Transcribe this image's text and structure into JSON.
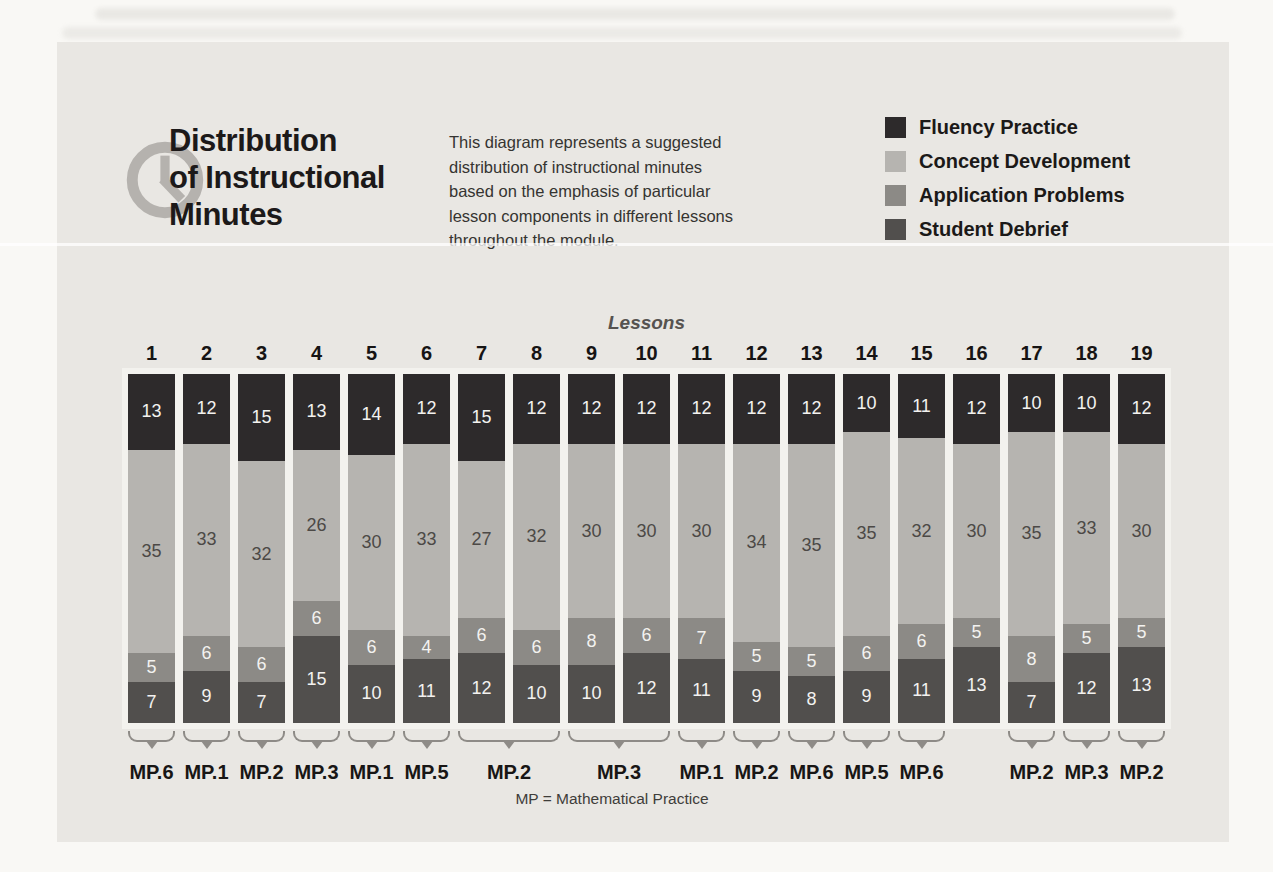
{
  "header": {
    "title_lines": [
      "Distribution",
      "of Instructional",
      "Minutes"
    ],
    "description": "This diagram represents a suggested distribution of instructional minutes based on the emphasis of particular lesson components in different lessons throughout the module."
  },
  "legend": {
    "items": [
      {
        "label": "Fluency Practice",
        "color": "#2d2a2b"
      },
      {
        "label": "Concept Development",
        "color": "#b6b4b0"
      },
      {
        "label": "Application Problems",
        "color": "#8c8a86"
      },
      {
        "label": "Student Debrief",
        "color": "#514f4d"
      }
    ]
  },
  "chart_data": {
    "type": "bar",
    "stacked": true,
    "axis_label": "Lessons",
    "total_per_bar": 60,
    "categories": [
      "1",
      "2",
      "3",
      "4",
      "5",
      "6",
      "7",
      "8",
      "9",
      "10",
      "11",
      "12",
      "13",
      "14",
      "15",
      "16",
      "17",
      "18",
      "19"
    ],
    "series": [
      {
        "name": "Fluency Practice",
        "color": "#2d2a2b",
        "text_color": "#f3f2f0",
        "values": [
          13,
          12,
          15,
          13,
          14,
          12,
          15,
          12,
          12,
          12,
          12,
          12,
          12,
          10,
          11,
          12,
          10,
          10,
          12
        ]
      },
      {
        "name": "Concept Development",
        "color": "#b6b4b0",
        "text_color": "#4c4946",
        "values": [
          35,
          33,
          32,
          26,
          30,
          33,
          27,
          32,
          30,
          30,
          30,
          34,
          35,
          35,
          32,
          30,
          35,
          33,
          30
        ]
      },
      {
        "name": "Application Problems",
        "color": "#8c8a86",
        "text_color": "#f3f2f0",
        "values": [
          5,
          6,
          6,
          6,
          6,
          4,
          6,
          6,
          8,
          6,
          7,
          5,
          5,
          6,
          6,
          5,
          8,
          5,
          5
        ]
      },
      {
        "name": "Student Debrief",
        "color": "#514f4d",
        "text_color": "#f3f2f0",
        "values": [
          7,
          9,
          7,
          15,
          10,
          11,
          12,
          10,
          10,
          12,
          11,
          9,
          8,
          9,
          11,
          13,
          7,
          12,
          13
        ]
      }
    ],
    "groups": [
      {
        "label": "MP.6",
        "start": 0,
        "span": 1
      },
      {
        "label": "MP.1",
        "start": 1,
        "span": 1
      },
      {
        "label": "MP.2",
        "start": 2,
        "span": 1
      },
      {
        "label": "MP.3",
        "start": 3,
        "span": 1
      },
      {
        "label": "MP.1",
        "start": 4,
        "span": 1
      },
      {
        "label": "MP.5",
        "start": 5,
        "span": 1
      },
      {
        "label": "MP.2",
        "start": 6,
        "span": 2
      },
      {
        "label": "MP.3",
        "start": 8,
        "span": 2
      },
      {
        "label": "MP.1",
        "start": 10,
        "span": 1
      },
      {
        "label": "MP.2",
        "start": 11,
        "span": 1
      },
      {
        "label": "MP.6",
        "start": 12,
        "span": 1
      },
      {
        "label": "MP.5",
        "start": 13,
        "span": 1
      },
      {
        "label": "MP.6",
        "start": 14,
        "span": 1
      },
      {
        "label": "MP.2",
        "start": 16,
        "span": 1
      },
      {
        "label": "MP.3",
        "start": 17,
        "span": 1
      },
      {
        "label": "MP.2",
        "start": 18,
        "span": 1
      }
    ]
  },
  "footnote": "MP = Mathematical Practice"
}
